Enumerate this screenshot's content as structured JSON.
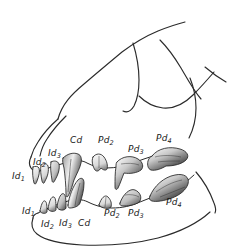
{
  "figure": {
    "view": "lateral / left side profile",
    "style": "pen-and-ink stippled scientific line drawing",
    "background_color": "#ffffff",
    "ink_color": "#2b2b2b",
    "shade_dark": "#3a3a3a",
    "shade_mid": "#8d8d8d",
    "shade_light": "#d6d6d6"
  },
  "labels": {
    "upper_jaw": [
      {
        "id": "upper-id1",
        "base": "Id",
        "sub": "1",
        "text": "Id1",
        "x": 12,
        "y": 179
      },
      {
        "id": "upper-id2",
        "base": "Id",
        "sub": "2",
        "text": "Id2",
        "x": 33,
        "y": 165
      },
      {
        "id": "upper-id3",
        "base": "Id",
        "sub": "3",
        "text": "Id3",
        "x": 48,
        "y": 156
      },
      {
        "id": "upper-cd",
        "base": "Cd",
        "sub": "",
        "text": "Cd",
        "x": 70,
        "y": 143
      },
      {
        "id": "upper-pd2",
        "base": "Pd",
        "sub": "2",
        "text": "Pd2",
        "x": 98,
        "y": 143
      },
      {
        "id": "upper-pd3",
        "base": "Pd",
        "sub": "3",
        "text": "Pd3",
        "x": 128,
        "y": 152
      },
      {
        "id": "upper-pd4",
        "base": "Pd",
        "sub": "4",
        "text": "Pd4",
        "x": 156,
        "y": 141
      }
    ],
    "lower_jaw": [
      {
        "id": "lower-id1",
        "base": "Id",
        "sub": "1",
        "text": "Id1",
        "x": 22,
        "y": 214
      },
      {
        "id": "lower-id2",
        "base": "Id",
        "sub": "2",
        "text": "Id2",
        "x": 41,
        "y": 227
      },
      {
        "id": "lower-id3",
        "base": "Id",
        "sub": "3",
        "text": "Id3",
        "x": 59,
        "y": 226
      },
      {
        "id": "lower-cd",
        "base": "Cd",
        "sub": "",
        "text": "Cd",
        "x": 78,
        "y": 226
      },
      {
        "id": "lower-pd2",
        "base": "Pd",
        "sub": "2",
        "text": "Pd2",
        "x": 104,
        "y": 216
      },
      {
        "id": "lower-pd3",
        "base": "Pd",
        "sub": "3",
        "text": "Pd3",
        "x": 128,
        "y": 216
      },
      {
        "id": "lower-pd4",
        "base": "Pd",
        "sub": "4",
        "text": "Pd4",
        "x": 166,
        "y": 205
      }
    ]
  },
  "legend_meaning": {
    "Id": "deciduous incisor",
    "Cd": "deciduous canine",
    "Pd": "deciduous premolar"
  }
}
